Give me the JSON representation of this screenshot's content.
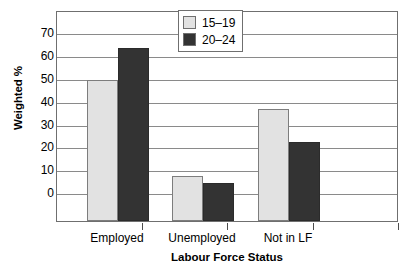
{
  "chart_data": {
    "type": "bar",
    "title": "",
    "xlabel": "Labour Force Status",
    "ylabel": "Weighted %",
    "categories": [
      "Employed",
      "Unemployed",
      "Not in LF"
    ],
    "series": [
      {
        "name": "15–19",
        "color": "#e2e2e2",
        "values": [
          49,
          7,
          36.5
        ]
      },
      {
        "name": "20–24",
        "color": "#333333",
        "values": [
          63,
          4,
          22
        ]
      }
    ],
    "ylim": [
      0,
      75
    ],
    "yticks": [
      0,
      10,
      20,
      30,
      40,
      50,
      60,
      70
    ],
    "ytick_labels": [
      "0",
      "10",
      "20",
      "30",
      "40",
      "50",
      "60",
      "70"
    ],
    "grid": true,
    "legend_position": "top-center"
  },
  "legend": {
    "items": [
      {
        "label": "15–19",
        "swatch": "light-gray-swatch-icon"
      },
      {
        "label": "20–24",
        "swatch": "dark-swatch-icon"
      }
    ]
  }
}
